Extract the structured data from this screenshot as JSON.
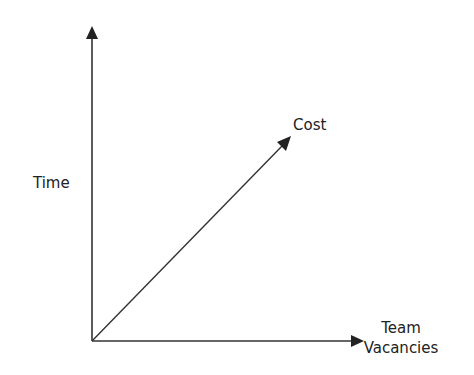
{
  "diagram": {
    "axes": {
      "y_label": "Time",
      "x_label_line1": "Team",
      "x_label_line2": "Vacancies"
    },
    "vector": {
      "label": "Cost"
    },
    "colors": {
      "stroke": "#333333",
      "text": "#222222"
    }
  }
}
